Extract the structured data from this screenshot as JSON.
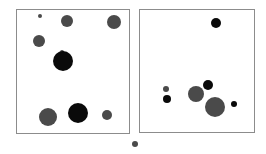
{
  "colors": {
    "black": "#0a0a0a",
    "gray": "#4a4a4a",
    "frame": "#8c8c8c"
  },
  "panels": [
    {
      "name": "left-panel",
      "box": {
        "x": 16,
        "y": 9,
        "w": 113,
        "h": 124
      },
      "circles": [
        {
          "cx": 40,
          "cy": 16,
          "r": 2,
          "fill": "gray"
        },
        {
          "cx": 67,
          "cy": 21,
          "r": 6,
          "fill": "gray"
        },
        {
          "cx": 114,
          "cy": 22,
          "r": 7,
          "fill": "gray"
        },
        {
          "cx": 39,
          "cy": 41,
          "r": 6,
          "fill": "gray"
        },
        {
          "cx": 62,
          "cy": 52,
          "r": 2,
          "fill": "gray"
        },
        {
          "cx": 63,
          "cy": 61,
          "r": 10,
          "fill": "black"
        },
        {
          "cx": 48,
          "cy": 117,
          "r": 9,
          "fill": "gray"
        },
        {
          "cx": 78,
          "cy": 113,
          "r": 10,
          "fill": "black"
        },
        {
          "cx": 107,
          "cy": 115,
          "r": 5,
          "fill": "gray"
        }
      ]
    },
    {
      "name": "right-panel",
      "box": {
        "x": 139,
        "y": 9,
        "w": 115,
        "h": 123
      },
      "circles": [
        {
          "cx": 216,
          "cy": 23,
          "r": 5,
          "fill": "black"
        },
        {
          "cx": 166,
          "cy": 89,
          "r": 3,
          "fill": "gray"
        },
        {
          "cx": 167,
          "cy": 99,
          "r": 4,
          "fill": "black"
        },
        {
          "cx": 196,
          "cy": 94,
          "r": 8,
          "fill": "gray"
        },
        {
          "cx": 208,
          "cy": 85,
          "r": 5,
          "fill": "black"
        },
        {
          "cx": 215,
          "cy": 107,
          "r": 10,
          "fill": "gray"
        },
        {
          "cx": 234,
          "cy": 104,
          "r": 3,
          "fill": "black"
        }
      ]
    }
  ],
  "extra_marker": {
    "cx": 135,
    "cy": 144,
    "r": 3,
    "fill": "gray"
  }
}
